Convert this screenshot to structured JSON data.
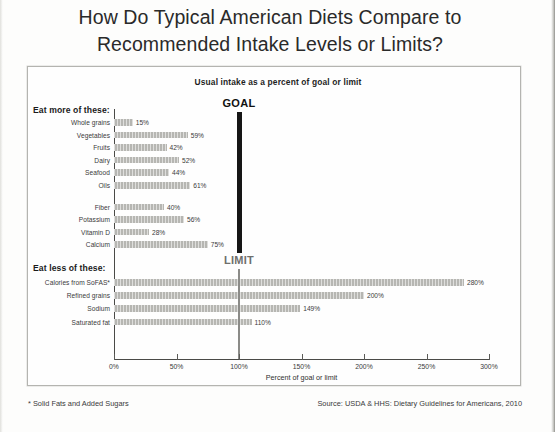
{
  "title": {
    "line1": "How Do Typical American Diets Compare to",
    "line2": "Recommended Intake Levels or Limits?"
  },
  "footnotes": {
    "left": "* Solid Fats and Added Sugars",
    "right": "Source: USDA & HHS: Dietary Guidelines for Americans, 2010"
  },
  "chart_data": {
    "type": "bar",
    "orientation": "horizontal",
    "title": "Usual intake as a percent of goal or limit",
    "xlabel": "Percent of goal or limit",
    "ylabel": "",
    "xlim": [
      0,
      300
    ],
    "xticks": [
      "0%",
      "50%",
      "100%",
      "150%",
      "200%",
      "250%",
      "300%"
    ],
    "xtick_values": [
      0,
      50,
      100,
      150,
      200,
      250,
      300
    ],
    "grid": false,
    "legend": "none",
    "groups": [
      {
        "label": "Eat more of these:",
        "marker_label": "GOAL",
        "marker_value": 100,
        "categories": [
          "Whole grains",
          "Vegetables",
          "Fruits",
          "Dairy",
          "Seafood",
          "Oils",
          "Fiber",
          "Potassium",
          "Vitamin D",
          "Calcium"
        ],
        "values": [
          15,
          59,
          42,
          52,
          44,
          61,
          40,
          56,
          28,
          75
        ],
        "value_labels": [
          "15%",
          "59%",
          "42%",
          "52%",
          "44%",
          "61%",
          "40%",
          "56%",
          "28%",
          "75%"
        ]
      },
      {
        "label": "Eat less of these:",
        "marker_label": "LIMIT",
        "marker_value": 100,
        "categories": [
          "Calories from SoFAS*",
          "Refined grains",
          "Sodium",
          "Saturated fat"
        ],
        "values": [
          280,
          200,
          149,
          110
        ],
        "value_labels": [
          "280%",
          "200%",
          "149%",
          "110%"
        ]
      }
    ],
    "colors": {
      "bar": "#b6b6b2",
      "goal_marker": "#161616",
      "limit_marker": "#8b8b88",
      "axis": "#4a4a47",
      "background": "#fefefe"
    }
  }
}
